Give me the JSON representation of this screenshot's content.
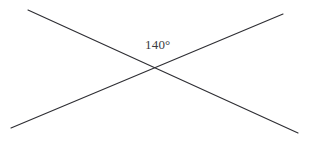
{
  "figure": {
    "background_color": "#ffffff",
    "line_color": "#2e2e33",
    "label_color": "#3a3a3f",
    "angle_label": "140°",
    "angle_value": 140,
    "angle_unit": "degrees",
    "intersection": {
      "x": 152,
      "y": 68
    },
    "lines": [
      {
        "name": "line-falling",
        "description": "line from upper-left to lower-right",
        "x1": 28,
        "y1": 10,
        "x2": 298,
        "y2": 133
      },
      {
        "name": "line-rising",
        "description": "line from lower-left to upper-right",
        "x1": 11,
        "y1": 128,
        "x2": 283,
        "y2": 14
      }
    ],
    "label_position": {
      "x": 145,
      "y": 38
    }
  }
}
